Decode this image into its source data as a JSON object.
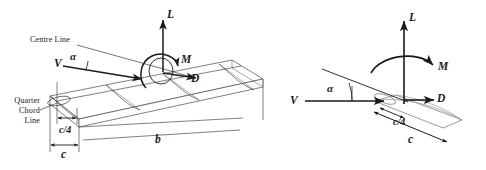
{
  "figure": {
    "background_color": "#ffffff",
    "line_color": "#1a1a1a",
    "wing_outline_color": "#8a8a8a",
    "width": 486,
    "height": 170
  },
  "left_diagram": {
    "name": "three-dimensional-wing-view",
    "labels": {
      "centre_line": "Centre Line",
      "quarter_chord_line_1": "Quarter",
      "quarter_chord_line_2": "Chord",
      "quarter_chord_line_3": "Line",
      "velocity": "V",
      "alpha": "α",
      "lift": "L",
      "moment": "M",
      "drag": "D",
      "quarter_chord": "c/4",
      "chord": "c",
      "span": "b"
    }
  },
  "right_diagram": {
    "name": "two-dimensional-airfoil-section-view",
    "labels": {
      "velocity": "V",
      "alpha": "α",
      "lift": "L",
      "moment": "M",
      "drag": "D",
      "quarter_chord": "c/4",
      "chord": "c"
    }
  }
}
